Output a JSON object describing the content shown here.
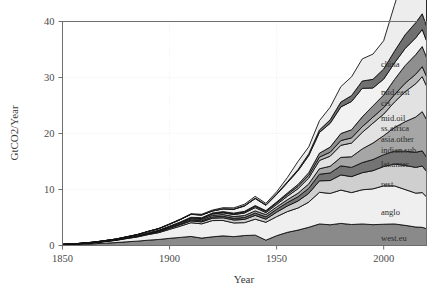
{
  "figure": {
    "background": "#ffffff",
    "frame_color": "#6f6f6f",
    "grid_color": "#e8e8e8"
  },
  "axes": {
    "x_title": "Year",
    "y_title": "GtCO2/Year",
    "x_ticks": [
      "1850",
      "1900",
      "1950",
      "2000"
    ],
    "x_tick_values": [
      1850,
      1900,
      1950,
      2000
    ],
    "y_ticks": [
      "0",
      "10",
      "20",
      "30",
      "40"
    ],
    "y_tick_values": [
      0,
      10,
      20,
      30,
      40
    ]
  },
  "chart_data": {
    "type": "area",
    "title": "",
    "subtitle": "",
    "xlabel": "Year",
    "ylabel": "GtCO2/Year",
    "xlim": [
      1850,
      2020
    ],
    "ylim": [
      0,
      40
    ],
    "grid": true,
    "stacked": true,
    "legend_position": "inline-right",
    "annotations": [],
    "x": [
      1850,
      1855,
      1860,
      1865,
      1870,
      1875,
      1880,
      1885,
      1890,
      1895,
      1900,
      1905,
      1910,
      1915,
      1920,
      1925,
      1930,
      1935,
      1940,
      1945,
      1950,
      1955,
      1960,
      1965,
      1970,
      1975,
      1980,
      1985,
      1990,
      1995,
      2000,
      2005,
      2010,
      2015,
      2018,
      2020
    ],
    "series": [
      {
        "name": "west.eu",
        "label": "west.eu",
        "color": "#8a8a8a",
        "values": [
          0.12,
          0.17,
          0.24,
          0.32,
          0.42,
          0.52,
          0.66,
          0.78,
          0.95,
          1.08,
          1.28,
          1.45,
          1.62,
          1.32,
          1.55,
          1.72,
          1.58,
          1.78,
          1.85,
          0.95,
          1.75,
          2.35,
          2.75,
          3.25,
          3.85,
          3.7,
          3.95,
          3.75,
          3.85,
          3.72,
          3.8,
          3.85,
          3.6,
          3.3,
          3.25,
          3.0
        ]
      },
      {
        "name": "anglo",
        "label": "anglo",
        "color": "#efefef",
        "values": [
          0.05,
          0.08,
          0.12,
          0.18,
          0.28,
          0.4,
          0.58,
          0.75,
          1.0,
          1.22,
          1.6,
          2.0,
          2.45,
          2.55,
          2.9,
          2.75,
          2.45,
          2.3,
          2.85,
          3.2,
          3.4,
          3.7,
          3.95,
          4.5,
          5.65,
          5.6,
          5.95,
          5.7,
          6.1,
          6.4,
          6.85,
          6.8,
          6.4,
          6.05,
          6.2,
          5.7
        ]
      },
      {
        "name": "rest",
        "label": "rest",
        "color": "#cfcfcf",
        "values": [
          0.01,
          0.01,
          0.02,
          0.03,
          0.04,
          0.05,
          0.07,
          0.09,
          0.12,
          0.15,
          0.2,
          0.25,
          0.32,
          0.35,
          0.42,
          0.48,
          0.52,
          0.58,
          0.68,
          0.55,
          0.8,
          1.0,
          1.25,
          1.55,
          2.05,
          2.3,
          2.7,
          2.85,
          3.05,
          3.25,
          3.45,
          3.9,
          4.3,
          4.6,
          4.75,
          4.55
        ]
      },
      {
        "name": "lat.amer",
        "label": "lat.amer",
        "color": "#747474",
        "values": [
          0.0,
          0.0,
          0.01,
          0.01,
          0.02,
          0.02,
          0.03,
          0.04,
          0.06,
          0.08,
          0.1,
          0.13,
          0.17,
          0.19,
          0.24,
          0.28,
          0.3,
          0.34,
          0.4,
          0.42,
          0.5,
          0.62,
          0.76,
          0.92,
          1.18,
          1.35,
          1.62,
          1.65,
          1.8,
          1.98,
          2.12,
          2.3,
          2.55,
          2.7,
          2.7,
          2.55
        ]
      },
      {
        "name": "indian.sub",
        "label": "indian.sub",
        "color": "#a6a6a6",
        "values": [
          0.0,
          0.01,
          0.01,
          0.02,
          0.03,
          0.04,
          0.05,
          0.07,
          0.09,
          0.11,
          0.14,
          0.17,
          0.21,
          0.23,
          0.27,
          0.3,
          0.32,
          0.35,
          0.4,
          0.4,
          0.42,
          0.5,
          0.62,
          0.78,
          0.98,
          1.2,
          1.52,
          1.9,
          2.45,
          2.95,
          3.4,
          4.2,
          5.25,
          6.3,
          7.0,
          6.7
        ]
      },
      {
        "name": "asia.other",
        "label": "asia.other",
        "color": "#e2e2e2",
        "values": [
          0.0,
          0.0,
          0.0,
          0.01,
          0.01,
          0.02,
          0.02,
          0.03,
          0.04,
          0.06,
          0.08,
          0.11,
          0.15,
          0.18,
          0.24,
          0.3,
          0.35,
          0.45,
          0.58,
          0.35,
          0.45,
          0.62,
          0.82,
          1.05,
          1.48,
          1.8,
          2.15,
          2.45,
          2.95,
          3.55,
          3.85,
          4.55,
          5.35,
          5.95,
          6.25,
          6.0
        ]
      },
      {
        "name": "ss.africa",
        "label": "ss.africa",
        "color": "#b8b8b8",
        "values": [
          0.0,
          0.0,
          0.0,
          0.0,
          0.01,
          0.01,
          0.01,
          0.02,
          0.02,
          0.03,
          0.04,
          0.06,
          0.08,
          0.09,
          0.12,
          0.14,
          0.16,
          0.18,
          0.22,
          0.22,
          0.26,
          0.32,
          0.4,
          0.48,
          0.6,
          0.7,
          0.85,
          0.92,
          1.02,
          1.08,
          1.15,
          1.32,
          1.52,
          1.7,
          1.78,
          1.72
        ]
      },
      {
        "name": "mid.oil",
        "label": "mid.oil",
        "color": "#8f8f8f",
        "values": [
          0.0,
          0.0,
          0.0,
          0.0,
          0.0,
          0.0,
          0.01,
          0.01,
          0.01,
          0.02,
          0.02,
          0.03,
          0.04,
          0.05,
          0.06,
          0.08,
          0.1,
          0.12,
          0.15,
          0.14,
          0.18,
          0.25,
          0.35,
          0.48,
          0.7,
          0.92,
          1.25,
          1.45,
          1.75,
          2.0,
          2.25,
          2.7,
          3.15,
          3.5,
          3.6,
          3.4
        ]
      },
      {
        "name": "cis",
        "label": "cis",
        "color": "#f2f2f2",
        "values": [
          0.02,
          0.03,
          0.04,
          0.05,
          0.07,
          0.09,
          0.12,
          0.16,
          0.21,
          0.26,
          0.34,
          0.42,
          0.52,
          0.48,
          0.35,
          0.48,
          0.68,
          0.95,
          1.25,
          0.95,
          1.35,
          1.85,
          2.45,
          3.05,
          3.7,
          4.25,
          4.75,
          5.05,
          5.1,
          3.2,
          2.85,
          2.95,
          3.05,
          3.0,
          3.05,
          2.95
        ]
      },
      {
        "name": "mid.east",
        "label": "mid.east",
        "color": "#707070",
        "values": [
          0.0,
          0.0,
          0.0,
          0.0,
          0.0,
          0.0,
          0.0,
          0.0,
          0.01,
          0.01,
          0.01,
          0.02,
          0.02,
          0.03,
          0.04,
          0.05,
          0.06,
          0.08,
          0.1,
          0.1,
          0.12,
          0.16,
          0.22,
          0.3,
          0.45,
          0.62,
          0.88,
          1.05,
          1.3,
          1.55,
          1.8,
          2.1,
          2.45,
          2.7,
          2.8,
          2.65
        ]
      },
      {
        "name": "china",
        "label": "china",
        "color": "#ededed",
        "values": [
          0.0,
          0.0,
          0.0,
          0.01,
          0.01,
          0.01,
          0.02,
          0.02,
          0.03,
          0.04,
          0.05,
          0.07,
          0.09,
          0.11,
          0.14,
          0.17,
          0.2,
          0.24,
          0.3,
          0.25,
          0.35,
          0.75,
          1.45,
          1.25,
          1.65,
          2.25,
          2.75,
          3.35,
          3.95,
          4.5,
          5.05,
          8.2,
          11.4,
          12.55,
          13.3,
          12.2
        ]
      }
    ],
    "series_labels": [
      {
        "name": "china",
        "label": "china",
        "y_px": 67
      },
      {
        "name": "mid.east",
        "label": "mid.east",
        "y_px": 95
      },
      {
        "name": "cis",
        "label": "cis",
        "y_px": 106
      },
      {
        "name": "mid.oil",
        "label": "mid.oil",
        "y_px": 121
      },
      {
        "name": "ss.africa",
        "label": "ss.africa",
        "y_px": 131
      },
      {
        "name": "asia.other",
        "label": "asia.other",
        "y_px": 142
      },
      {
        "name": "indian.sub",
        "label": "indian.sub",
        "y_px": 153
      },
      {
        "name": "lat.amer",
        "label": "lat.amer",
        "y_px": 167
      },
      {
        "name": "rest",
        "label": "rest",
        "y_px": 187
      },
      {
        "name": "anglo",
        "label": "anglo",
        "y_px": 215
      },
      {
        "name": "west.eu",
        "label": "west.eu",
        "y_px": 241
      }
    ]
  }
}
